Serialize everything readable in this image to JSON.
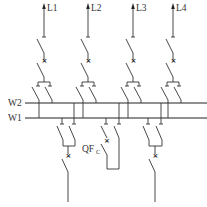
{
  "diagram": {
    "type": "double-busbar single-line diagram",
    "buses": [
      {
        "id": "W2",
        "label": "W2"
      },
      {
        "id": "W1",
        "label": "W1"
      }
    ],
    "outgoing_feeders": [
      {
        "id": "L1",
        "label": "L1"
      },
      {
        "id": "L2",
        "label": "L2"
      },
      {
        "id": "L3",
        "label": "L3"
      },
      {
        "id": "L4",
        "label": "L4"
      }
    ],
    "bus_coupler": {
      "label_main": "QF",
      "label_sub": "C"
    },
    "incoming_feeders_count": 2,
    "breaker_symbol": "×",
    "colors": {
      "line": "#333333",
      "background": "#ffffff"
    }
  }
}
